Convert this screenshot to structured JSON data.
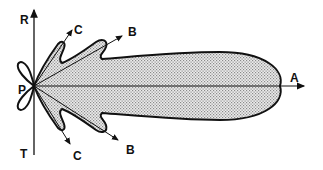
{
  "diagram": {
    "type": "radiation-pattern-lobe-diagram",
    "labels": {
      "origin": "P",
      "vertical_top": "R",
      "vertical_bottom": "T",
      "main_lobe": "A",
      "side_lobe_upper_b": "B",
      "side_lobe_upper_c": "C",
      "side_lobe_lower_b": "B",
      "side_lobe_lower_c": "C"
    },
    "colors": {
      "outline": "#111111",
      "fill_stipple": "#bdbdbd",
      "background": "#ffffff"
    }
  }
}
